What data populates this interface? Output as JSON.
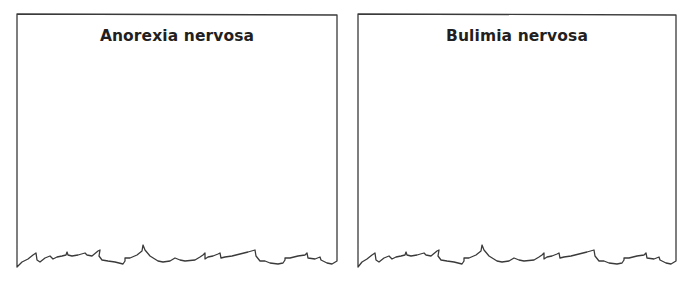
{
  "panels": [
    {
      "title": "Anorexia nervosa",
      "content": ""
    },
    {
      "title": "Bulimia nervosa",
      "content": ""
    }
  ],
  "style": {
    "border_color": "#3a3a3a",
    "title_color": "#231f20",
    "background": "#ffffff"
  }
}
